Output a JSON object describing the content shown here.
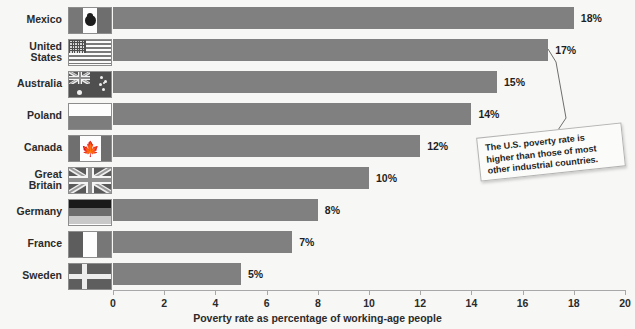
{
  "chart_data": {
    "type": "bar",
    "orientation": "horizontal",
    "title": "",
    "xlabel": "Poverty rate as percentage of working-age people",
    "ylabel": "",
    "xlim": [
      0,
      20
    ],
    "xticks": [
      0,
      2,
      4,
      6,
      8,
      10,
      12,
      14,
      16,
      18,
      20
    ],
    "grid": false,
    "legend": null,
    "bar_color": "#808080",
    "background_color": "#f7f7f5",
    "categories": [
      "Mexico",
      "United States",
      "Australia",
      "Poland",
      "Canada",
      "Great Britain",
      "Germany",
      "France",
      "Sweden"
    ],
    "values": [
      18,
      17,
      15,
      14,
      12,
      10,
      8,
      7,
      5
    ],
    "value_labels": [
      "18%",
      "17%",
      "15%",
      "14%",
      "12%",
      "10%",
      "8%",
      "7%",
      "5%"
    ],
    "annotations": [
      {
        "text": "The U.S. poverty rate is higher than those of most other industrial countries.",
        "points_to": "United States"
      }
    ]
  },
  "rows": [
    {
      "name": "Mexico",
      "name_display": "Mexico",
      "flag": "flag-mexico",
      "value": 18,
      "value_label": "18%"
    },
    {
      "name": "United States",
      "name_display": "United\nStates",
      "flag": "flag-united-states",
      "value": 17,
      "value_label": "17%"
    },
    {
      "name": "Australia",
      "name_display": "Australia",
      "flag": "flag-australia",
      "value": 15,
      "value_label": "15%"
    },
    {
      "name": "Poland",
      "name_display": "Poland",
      "flag": "flag-poland",
      "value": 14,
      "value_label": "14%"
    },
    {
      "name": "Canada",
      "name_display": "Canada",
      "flag": "flag-canada",
      "value": 12,
      "value_label": "12%"
    },
    {
      "name": "Great Britain",
      "name_display": "Great Britain",
      "flag": "flag-great-britain",
      "value": 10,
      "value_label": "10%"
    },
    {
      "name": "Germany",
      "name_display": "Germany",
      "flag": "flag-germany",
      "value": 8,
      "value_label": "8%"
    },
    {
      "name": "France",
      "name_display": "France",
      "flag": "flag-france",
      "value": 7,
      "value_label": "7%"
    },
    {
      "name": "Sweden",
      "name_display": "Sweden",
      "flag": "flag-sweden",
      "value": 5,
      "value_label": "5%"
    }
  ],
  "axis": {
    "ticks": [
      "0",
      "2",
      "4",
      "6",
      "8",
      "10",
      "12",
      "14",
      "16",
      "18",
      "20"
    ],
    "title": "Poverty rate as percentage of working-age people"
  },
  "callout": {
    "text": "The U.S. poverty rate is higher than those of most other industrial countries."
  }
}
